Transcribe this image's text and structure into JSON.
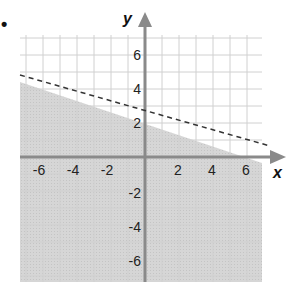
{
  "marker": "•",
  "chart_data": {
    "type": "line",
    "title": "",
    "xlabel": "x",
    "ylabel": "y",
    "xlim": [
      -7.3,
      7
    ],
    "ylim": [
      -7.5,
      7.3
    ],
    "grid": true,
    "grid_step": 1,
    "x_ticks": [
      "-6",
      "-4",
      "-2",
      "2",
      "4",
      "6"
    ],
    "y_ticks": [
      "6",
      "4",
      "2",
      "-2",
      "-4",
      "-6"
    ],
    "boundary_line": {
      "style": "dashed",
      "slope": -0.3333,
      "intercept": 2,
      "equation": "y = -1/3 x + 2",
      "points": [
        [
          -7.3,
          4.43
        ],
        [
          7,
          -0.33
        ]
      ]
    },
    "shaded_region": "below",
    "inequality": "y < -1/3 x + 2",
    "colors": {
      "shade": "#d4d4d4",
      "grid": "#cfcfcf",
      "axis": "#8a8a8a",
      "line": "#333333"
    }
  }
}
